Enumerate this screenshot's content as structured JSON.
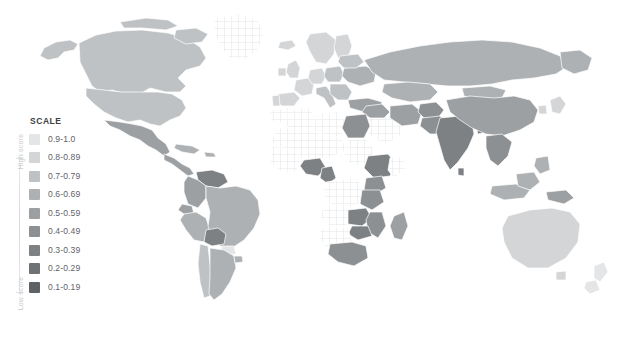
{
  "legend": {
    "title": "SCALE",
    "axis_high_label": "High score",
    "axis_low_label": "Low score",
    "items": [
      {
        "label": "0.9-1.0",
        "color": "#e3e5e6",
        "range": [
          0.9,
          1.0
        ]
      },
      {
        "label": "0.8-0.89",
        "color": "#d3d5d7",
        "range": [
          0.8,
          0.89
        ]
      },
      {
        "label": "0.7-0.79",
        "color": "#bfc2c4",
        "range": [
          0.7,
          0.79
        ]
      },
      {
        "label": "0.6-0.69",
        "color": "#aeb1b3",
        "range": [
          0.6,
          0.69
        ]
      },
      {
        "label": "0.5-0.59",
        "color": "#9da0a3",
        "range": [
          0.5,
          0.59
        ]
      },
      {
        "label": "0.4-0.49",
        "color": "#8d9093",
        "range": [
          0.4,
          0.49
        ]
      },
      {
        "label": "0.3-0.39",
        "color": "#7e8184",
        "range": [
          0.3,
          0.39
        ]
      },
      {
        "label": "0.2-0.29",
        "color": "#6f7275",
        "range": [
          0.2,
          0.29
        ]
      },
      {
        "label": "0.1-0.19",
        "color": "#5f6265",
        "range": [
          0.1,
          0.19
        ]
      }
    ]
  },
  "chart_data": {
    "type": "choropleth-map",
    "title": "",
    "legend_title": "SCALE",
    "value_label": "score",
    "scale_direction": "light = high score, dark = low score",
    "no_data_style": "hatched",
    "bins": [
      "0.9-1.0",
      "0.8-0.89",
      "0.7-0.79",
      "0.6-0.69",
      "0.5-0.59",
      "0.4-0.49",
      "0.3-0.39",
      "0.2-0.29",
      "0.1-0.19"
    ],
    "bin_colors": [
      "#e3e5e6",
      "#d3d5d7",
      "#bfc2c4",
      "#aeb1b3",
      "#9da0a3",
      "#8d9093",
      "#7e8184",
      "#6f7275",
      "#5f6265"
    ],
    "regions": [
      {
        "name": "Canada",
        "bin": "0.7-0.79",
        "color": "#bfc2c4"
      },
      {
        "name": "United States",
        "bin": "0.7-0.79",
        "color": "#bfc2c4"
      },
      {
        "name": "Greenland",
        "bin": "no-data",
        "color": "hatched"
      },
      {
        "name": "Mexico",
        "bin": "0.5-0.59",
        "color": "#9da0a3"
      },
      {
        "name": "Central America",
        "bin": "0.5-0.59",
        "color": "#9da0a3"
      },
      {
        "name": "Cuba",
        "bin": "0.6-0.69",
        "color": "#aeb1b3"
      },
      {
        "name": "Colombia",
        "bin": "0.5-0.59",
        "color": "#9da0a3"
      },
      {
        "name": "Venezuela",
        "bin": "0.3-0.39",
        "color": "#7e8184"
      },
      {
        "name": "Peru",
        "bin": "0.6-0.69",
        "color": "#aeb1b3"
      },
      {
        "name": "Brazil",
        "bin": "0.6-0.69",
        "color": "#aeb1b3"
      },
      {
        "name": "Bolivia",
        "bin": "0.3-0.39",
        "color": "#7e8184"
      },
      {
        "name": "Paraguay",
        "bin": "0.9-1.0",
        "color": "#e3e5e6"
      },
      {
        "name": "Chile",
        "bin": "0.7-0.79",
        "color": "#bfc2c4"
      },
      {
        "name": "Argentina",
        "bin": "0.6-0.69",
        "color": "#aeb1b3"
      },
      {
        "name": "United Kingdom",
        "bin": "0.8-0.89",
        "color": "#d3d5d7"
      },
      {
        "name": "France",
        "bin": "0.8-0.89",
        "color": "#d3d5d7"
      },
      {
        "name": "Spain",
        "bin": "0.8-0.89",
        "color": "#d3d5d7"
      },
      {
        "name": "Germany",
        "bin": "0.8-0.89",
        "color": "#d3d5d7"
      },
      {
        "name": "Poland",
        "bin": "0.7-0.79",
        "color": "#bfc2c4"
      },
      {
        "name": "Italy",
        "bin": "0.7-0.79",
        "color": "#bfc2c4"
      },
      {
        "name": "Scandinavia",
        "bin": "0.8-0.89",
        "color": "#d3d5d7"
      },
      {
        "name": "Ukraine",
        "bin": "0.6-0.69",
        "color": "#aeb1b3"
      },
      {
        "name": "Turkey",
        "bin": "0.5-0.59",
        "color": "#9da0a3"
      },
      {
        "name": "Russia",
        "bin": "0.6-0.69",
        "color": "#aeb1b3"
      },
      {
        "name": "Kazakhstan",
        "bin": "0.6-0.69",
        "color": "#aeb1b3"
      },
      {
        "name": "Mongolia",
        "bin": "0.6-0.69",
        "color": "#aeb1b3"
      },
      {
        "name": "China",
        "bin": "0.5-0.59",
        "color": "#9da0a3"
      },
      {
        "name": "Japan",
        "bin": "0.8-0.89",
        "color": "#d3d5d7"
      },
      {
        "name": "India",
        "bin": "0.3-0.39",
        "color": "#7e8184"
      },
      {
        "name": "Pakistan",
        "bin": "0.4-0.49",
        "color": "#8d9093"
      },
      {
        "name": "Iran",
        "bin": "0.5-0.59",
        "color": "#9da0a3"
      },
      {
        "name": "Saudi Arabia",
        "bin": "no-data",
        "color": "hatched"
      },
      {
        "name": "Egypt",
        "bin": "0.4-0.49",
        "color": "#8d9093"
      },
      {
        "name": "Libya",
        "bin": "no-data",
        "color": "hatched"
      },
      {
        "name": "Algeria",
        "bin": "no-data",
        "color": "hatched"
      },
      {
        "name": "Nigeria",
        "bin": "0.3-0.39",
        "color": "#7e8184"
      },
      {
        "name": "Cameroon",
        "bin": "0.3-0.39",
        "color": "#7e8184"
      },
      {
        "name": "Ethiopia",
        "bin": "0.3-0.39",
        "color": "#7e8184"
      },
      {
        "name": "Kenya",
        "bin": "0.4-0.49",
        "color": "#8d9093"
      },
      {
        "name": "Tanzania",
        "bin": "0.4-0.49",
        "color": "#8d9093"
      },
      {
        "name": "Zambia",
        "bin": "0.3-0.39",
        "color": "#7e8184"
      },
      {
        "name": "Zimbabwe",
        "bin": "0.3-0.39",
        "color": "#7e8184"
      },
      {
        "name": "South Africa",
        "bin": "0.4-0.49",
        "color": "#8d9093"
      },
      {
        "name": "Madagascar",
        "bin": "0.5-0.59",
        "color": "#9da0a3"
      },
      {
        "name": "Indonesia",
        "bin": "0.6-0.69",
        "color": "#aeb1b3"
      },
      {
        "name": "Philippines",
        "bin": "0.6-0.69",
        "color": "#aeb1b3"
      },
      {
        "name": "Papua New Guinea",
        "bin": "0.5-0.59",
        "color": "#9da0a3"
      },
      {
        "name": "Australia",
        "bin": "0.8-0.89",
        "color": "#d3d5d7"
      },
      {
        "name": "New Zealand",
        "bin": "0.9-1.0",
        "color": "#e3e5e6"
      }
    ]
  }
}
